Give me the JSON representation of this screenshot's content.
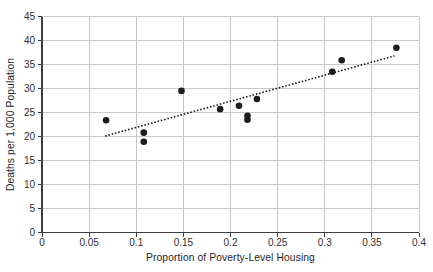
{
  "figure": {
    "background": "#ffffff",
    "width_px": 433,
    "height_px": 272
  },
  "chart_data": {
    "type": "scatter",
    "title": "",
    "xlabel": "Proportion of Poverty-Level Housing",
    "ylabel": "Deaths per 1,000 Population",
    "xlim": [
      0,
      0.4
    ],
    "ylim": [
      0,
      45
    ],
    "grid": true,
    "legend": "none",
    "x_ticks": [
      {
        "value": 0,
        "label": "0"
      },
      {
        "value": 0.05,
        "label": "0.05"
      },
      {
        "value": 0.1,
        "label": "0.1"
      },
      {
        "value": 0.15,
        "label": "0.15"
      },
      {
        "value": 0.2,
        "label": "0.2"
      },
      {
        "value": 0.25,
        "label": "0.25"
      },
      {
        "value": 0.3,
        "label": "0.3"
      },
      {
        "value": 0.35,
        "label": "0.35"
      },
      {
        "value": 0.4,
        "label": "0.4"
      }
    ],
    "y_ticks": [
      {
        "value": 0,
        "label": "0"
      },
      {
        "value": 5,
        "label": "5"
      },
      {
        "value": 10,
        "label": "10"
      },
      {
        "value": 15,
        "label": "15"
      },
      {
        "value": 20,
        "label": "20"
      },
      {
        "value": 25,
        "label": "25"
      },
      {
        "value": 30,
        "label": "30"
      },
      {
        "value": 35,
        "label": "35"
      },
      {
        "value": 40,
        "label": "40"
      },
      {
        "value": 45,
        "label": "45"
      }
    ],
    "points": [
      {
        "x": 0.068,
        "y": 23.4
      },
      {
        "x": 0.108,
        "y": 20.8
      },
      {
        "x": 0.108,
        "y": 18.9
      },
      {
        "x": 0.148,
        "y": 29.5
      },
      {
        "x": 0.189,
        "y": 25.7
      },
      {
        "x": 0.209,
        "y": 26.4
      },
      {
        "x": 0.218,
        "y": 24.3
      },
      {
        "x": 0.218,
        "y": 23.5
      },
      {
        "x": 0.228,
        "y": 27.8
      },
      {
        "x": 0.308,
        "y": 33.5
      },
      {
        "x": 0.318,
        "y": 35.9
      },
      {
        "x": 0.376,
        "y": 38.5
      }
    ],
    "trend_line": {
      "style": "dotted",
      "x1": 0.067,
      "y1": 20.1,
      "x2": 0.374,
      "y2": 36.8
    },
    "colors": {
      "point": "#1c1c1c",
      "trend": "#111111",
      "grid": "#c9c9c9",
      "axis": "#3d3d3d",
      "text": "#2e2e2e",
      "background": "#ffffff"
    }
  }
}
